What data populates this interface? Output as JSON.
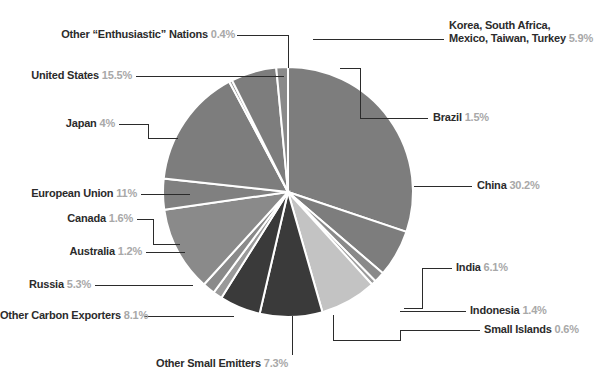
{
  "chart_data": {
    "type": "pie",
    "title": "",
    "subtitle": "",
    "legend_position": "callout-labels",
    "start_angle_deg": 0,
    "direction": "clockwise",
    "center": {
      "x": 288,
      "y": 192
    },
    "radius": 125,
    "separator_color": "#ffffff",
    "background": "#ffffff",
    "label_text_color": "#2b2b2b",
    "label_pct_color": "#a8a8a8",
    "leader_line_color": "#2b2b2b",
    "categories": [
      "China",
      "India",
      "Indonesia",
      "Small Islands",
      "Other Small Emitters",
      "Other Carbon Exporters",
      "Russia",
      "Australia",
      "Canada",
      "European Union",
      "Japan",
      "United States",
      "Other “Enthusiastic” Nations",
      "Korea, South Africa, Mexico, Taiwan, Turkey",
      "Brazil"
    ],
    "values": [
      30.2,
      6.1,
      1.4,
      0.6,
      7.3,
      8.1,
      5.3,
      1.2,
      1.6,
      11,
      4,
      15.5,
      0.4,
      5.9,
      1.5
    ],
    "colors": [
      "#7d7d7d",
      "#7d7d7d",
      "#8a8a8a",
      "#9c9c9c",
      "#c3c3c3",
      "#3a3a3a",
      "#3a3a3a",
      "#9a9a9a",
      "#8a8a8a",
      "#8a8a8a",
      "#808080",
      "#7d7d7d",
      "#9a9a9a",
      "#7d7d7d",
      "#8a8a8a"
    ]
  },
  "labels": [
    {
      "id": "other-enthusiastic-nations",
      "name": "Other “Enthusiastic” Nations",
      "pct": "0.4%"
    },
    {
      "id": "united-states",
      "name": "United States",
      "pct": "15.5%"
    },
    {
      "id": "japan",
      "name": "Japan",
      "pct": "4%"
    },
    {
      "id": "european-union",
      "name": "European Union",
      "pct": "11%"
    },
    {
      "id": "canada",
      "name": "Canada",
      "pct": "1.6%"
    },
    {
      "id": "australia",
      "name": "Australia",
      "pct": "1.2%"
    },
    {
      "id": "russia",
      "name": "Russia",
      "pct": "5.3%"
    },
    {
      "id": "other-carbon-exporters",
      "name": "Other Carbon Exporters",
      "pct": "8.1%"
    },
    {
      "id": "other-small-emitters",
      "name": "Other Small Emitters",
      "pct": "7.3%"
    },
    {
      "id": "small-islands",
      "name": "Small Islands",
      "pct": "0.6%"
    },
    {
      "id": "indonesia",
      "name": "Indonesia",
      "pct": "1.4%"
    },
    {
      "id": "india",
      "name": "India",
      "pct": "6.1%"
    },
    {
      "id": "china",
      "name": "China",
      "pct": "30.2%"
    },
    {
      "id": "brazil",
      "name": "Brazil",
      "pct": "1.5%"
    },
    {
      "id": "korea-group",
      "name_line1": "Korea, South Africa,",
      "name_line2": "Mexico, Taiwan, Turkey",
      "pct": "5.9%"
    }
  ]
}
